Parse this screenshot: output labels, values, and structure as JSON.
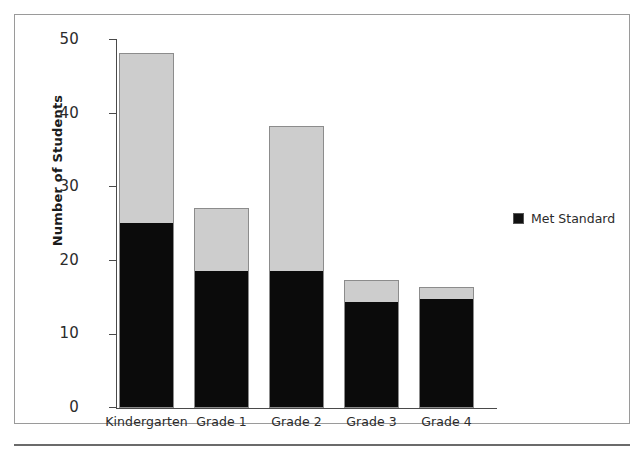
{
  "top_sliver_text": "",
  "legend": {
    "entries": [
      {
        "label": "Met Standard",
        "color": "#111111"
      }
    ]
  },
  "axis": {
    "y_title": "Number of Students",
    "y_ticks": [
      "0",
      "10",
      "20",
      "30",
      "40",
      "50"
    ],
    "x_ticks": [
      "Kindergarten",
      "Grade 1",
      "Grade 2",
      "Grade 3",
      "Grade 4"
    ]
  },
  "chart_data": {
    "type": "bar",
    "title": "",
    "subtitle": "",
    "xlabel": "",
    "ylabel": "Number of Students",
    "ylim": [
      0,
      50
    ],
    "yticks": [
      0,
      10,
      20,
      30,
      40,
      50
    ],
    "grid": false,
    "stacked": true,
    "legend_position": "right",
    "categories": [
      "Kindergarten",
      "Grade 1",
      "Grade 2",
      "Grade 3",
      "Grade 4"
    ],
    "series": [
      {
        "name": "Met Standard",
        "color": "#111111",
        "values": [
          25,
          18.5,
          18.5,
          14.3,
          14.7
        ]
      },
      {
        "name": "Total Students",
        "color": "#cdcdcd",
        "values": [
          48.2,
          27.2,
          38.3,
          17.4,
          16.4
        ]
      }
    ],
    "annotations": []
  },
  "bars": [
    {
      "category": "Kindergarten",
      "total": 48.2,
      "met": 25
    },
    {
      "category": "Grade 1",
      "total": 27.2,
      "met": 18.5
    },
    {
      "category": "Grade 2",
      "total": 38.3,
      "met": 18.5
    },
    {
      "category": "Grade 3",
      "total": 17.4,
      "met": 14.3
    },
    {
      "category": "Grade 4",
      "total": 16.4,
      "met": 14.7
    }
  ]
}
